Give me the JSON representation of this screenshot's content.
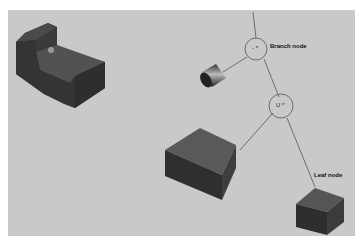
{
  "diagram": {
    "type": "csg-tree",
    "background_color": "#c9c9c9",
    "nodes": [
      {
        "id": "branch",
        "label": "Branch node",
        "symbol": "- *",
        "shape": "circle"
      },
      {
        "id": "union",
        "label": "",
        "symbol": "U *",
        "shape": "circle"
      },
      {
        "id": "leaf",
        "label": "Leaf node",
        "shape": "box"
      }
    ],
    "primitives": [
      {
        "name": "result-part",
        "shape": "stepped-block-with-hole"
      },
      {
        "name": "cylinder",
        "shape": "cylinder"
      },
      {
        "name": "large-box",
        "shape": "box"
      },
      {
        "name": "small-box",
        "shape": "box"
      }
    ],
    "edges": [
      [
        "root",
        "branch"
      ],
      [
        "branch",
        "cylinder"
      ],
      [
        "branch",
        "union"
      ],
      [
        "union",
        "large-box"
      ],
      [
        "union",
        "small-box"
      ]
    ]
  }
}
